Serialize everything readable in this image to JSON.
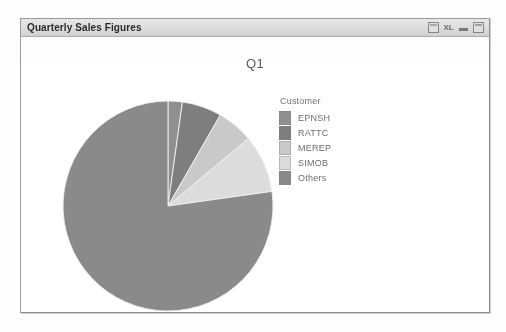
{
  "window": {
    "title": "Quarterly Sales Figures",
    "controls": [
      {
        "name": "export-icon",
        "glyph": ""
      },
      {
        "name": "excel-export-icon",
        "glyph": "XL"
      },
      {
        "name": "minimize-icon",
        "glyph": ""
      },
      {
        "name": "maximize-icon",
        "glyph": ""
      }
    ]
  },
  "legend": {
    "title": "Customer"
  },
  "chart_data": {
    "type": "pie",
    "title": "Q1",
    "xlabel": "",
    "ylabel": "",
    "legend_title": "Customer",
    "legend_position": "right",
    "grid": false,
    "start_angle_deg": 0,
    "direction": "clockwise",
    "categories": [
      "EPNSH",
      "RATTC",
      "MEREP",
      "SIMOB",
      "Others"
    ],
    "values": [
      2.2,
      6.1,
      5.6,
      8.9,
      77.2
    ],
    "value_unit": "percent",
    "slices": [
      {
        "label": "EPNSH",
        "value": 2.2,
        "color": "#8f8f8f",
        "start_deg": 0.0,
        "end_deg": 7.9
      },
      {
        "label": "RATTC",
        "value": 6.1,
        "color": "#7e7e7e",
        "start_deg": 7.9,
        "end_deg": 29.9
      },
      {
        "label": "MEREP",
        "value": 5.6,
        "color": "#c9c9c9",
        "start_deg": 29.9,
        "end_deg": 50.0
      },
      {
        "label": "SIMOB",
        "value": 8.9,
        "color": "#dcdcdc",
        "start_deg": 50.0,
        "end_deg": 82.0
      },
      {
        "label": "Others",
        "value": 77.2,
        "color": "#8a8a8a",
        "start_deg": 82.0,
        "end_deg": 360.0
      }
    ],
    "geometry": {
      "center_x": 147,
      "center_y": 187,
      "radius": 105
    }
  },
  "colors": {
    "window_border": "#9a9a9a",
    "titlebar_top": "#e9e9e9",
    "titlebar_bottom": "#d2d2d2",
    "canvas": "#ffffff",
    "text": "#6d6d6d",
    "slice_outline": "#f2f2f2"
  }
}
